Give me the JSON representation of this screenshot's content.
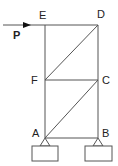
{
  "diagram": {
    "type": "truss",
    "nodes": [
      {
        "id": "E",
        "label": "E",
        "x": 45,
        "y": 25
      },
      {
        "id": "D",
        "label": "D",
        "x": 98,
        "y": 25
      },
      {
        "id": "F",
        "label": "F",
        "x": 45,
        "y": 80
      },
      {
        "id": "C",
        "label": "C",
        "x": 98,
        "y": 80
      },
      {
        "id": "A",
        "label": "A",
        "x": 45,
        "y": 138
      },
      {
        "id": "B",
        "label": "B",
        "x": 98,
        "y": 138
      }
    ],
    "members": [
      [
        "E",
        "D"
      ],
      [
        "E",
        "F"
      ],
      [
        "F",
        "A"
      ],
      [
        "D",
        "C"
      ],
      [
        "C",
        "B"
      ],
      [
        "F",
        "C"
      ],
      [
        "A",
        "B"
      ],
      [
        "F",
        "D"
      ],
      [
        "A",
        "C"
      ]
    ],
    "load": {
      "label": "P",
      "at": "E",
      "direction": "right"
    },
    "supports": [
      {
        "at": "A",
        "type": "pin"
      },
      {
        "at": "B",
        "type": "pin"
      }
    ],
    "colors": {
      "line": "#555555",
      "text": "#222222"
    }
  }
}
